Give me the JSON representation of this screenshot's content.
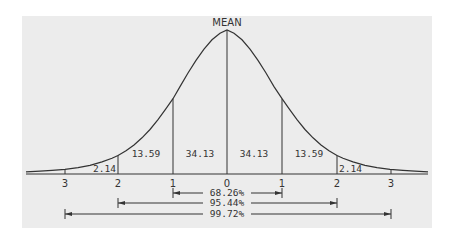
{
  "diagram": {
    "title_label": "MEAN",
    "colors": {
      "background": "#ececec",
      "line": "#333333",
      "text": "#333333"
    },
    "area_labels": {
      "left_3_2": "2.14",
      "left_2_1": "13.59",
      "left_1_0": "34.13",
      "right_0_1": "34.13",
      "right_1_2": "13.59",
      "right_2_3": "2.14"
    },
    "axis_ticks": {
      "neg3": "3",
      "neg2": "2",
      "neg1": "1",
      "zero": "0",
      "pos1": "1",
      "pos2": "2",
      "pos3": "3"
    },
    "ranges": {
      "one_sigma": "68.26%",
      "two_sigma": "95.44%",
      "three_sigma": "99.72%"
    }
  }
}
